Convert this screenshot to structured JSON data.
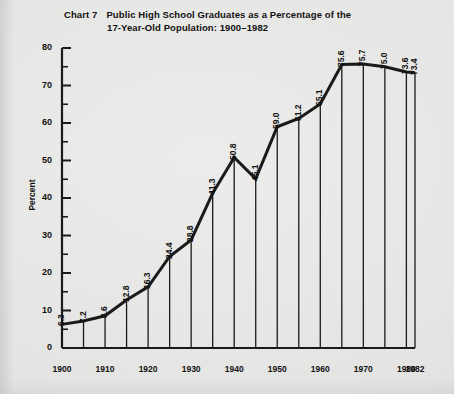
{
  "title": {
    "chart_number": "Chart 7",
    "line1": "Public High School Graduates as a Percentage of the",
    "line2": "17-Year-Old Population: 1900–1982"
  },
  "axis": {
    "ylabel": "Percent",
    "yticks": [
      "0",
      "10",
      "20",
      "30",
      "40",
      "50",
      "60",
      "70",
      "80"
    ],
    "xticks": [
      "1900",
      "1910",
      "1920",
      "1930",
      "1940",
      "1950",
      "1960",
      "1970",
      "1980",
      "1982"
    ]
  },
  "chart_data": {
    "type": "line",
    "xlabel": "",
    "ylabel": "Percent",
    "ylim": [
      0,
      80
    ],
    "xlim": [
      1900,
      1982
    ],
    "grid": false,
    "legend": "none",
    "x": [
      1900,
      1905,
      1910,
      1915,
      1920,
      1925,
      1930,
      1935,
      1940,
      1945,
      1950,
      1955,
      1960,
      1965,
      1970,
      1975,
      1980,
      1982
    ],
    "values": [
      6.3,
      7.2,
      8.6,
      12.8,
      16.3,
      24.4,
      28.8,
      41.3,
      50.8,
      45.1,
      59.0,
      61.2,
      65.1,
      75.6,
      75.7,
      75.0,
      73.6,
      73.4
    ],
    "point_labels": [
      "6.3",
      "7.2",
      "8.6",
      "12.8",
      "16.3",
      "24.4",
      "28.8",
      "41.3",
      "50.8",
      "45.1",
      "59.0",
      "61.2",
      "65.1",
      "75.6",
      "75.7",
      "75.0",
      "73.6",
      "73.4"
    ],
    "ytick_values": [
      0,
      10,
      20,
      30,
      40,
      50,
      60,
      70,
      80
    ],
    "xtick_values": [
      1900,
      1910,
      1920,
      1930,
      1940,
      1950,
      1960,
      1970,
      1980,
      1982
    ],
    "line_color": "#1a1a1a",
    "background_color": "#e8e8e6"
  }
}
